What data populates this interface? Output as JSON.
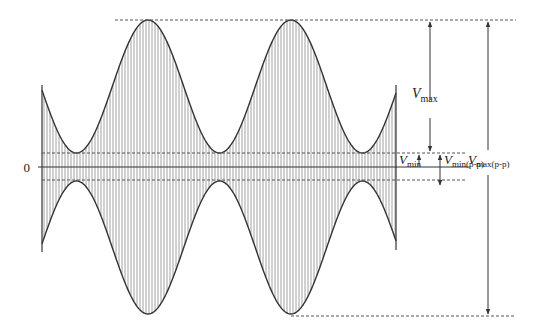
{
  "diagram": {
    "type": "amplitude-modulated waveform with envelope measurements",
    "zero_label": "0",
    "labels": {
      "vmax": {
        "main": "V",
        "sub": "max"
      },
      "vmin": {
        "main": "V",
        "sub": "min"
      },
      "vmin_pp": {
        "main": "V",
        "sub": "min(p-p)"
      },
      "vmax_pp": {
        "main": "V",
        "sub": "max(p-p)"
      }
    },
    "envelope": {
      "peaks_visible": 2,
      "valleys_visible": 3,
      "min_to_max_ratio": 0.105
    },
    "colors": {
      "line": "#333333",
      "hatch": "#8a8a8a",
      "dashed": "#555555"
    }
  }
}
